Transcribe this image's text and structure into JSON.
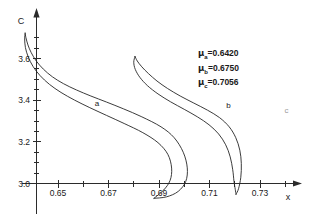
{
  "chart_data": {
    "type": "line",
    "title": "",
    "xlabel": "x",
    "ylabel": "C",
    "xlim": [
      0.632,
      0.742
    ],
    "ylim": [
      2.9,
      3.76
    ],
    "grid": false,
    "legend_position": "upper-right",
    "xticks": [
      "0.65",
      "0.67",
      "0.69",
      "0.71",
      "0.73"
    ],
    "xtick_values": [
      0.65,
      0.67,
      0.69,
      0.71,
      0.73
    ],
    "xminor_step": 0.01,
    "yticks": [
      "3.0",
      "3.2",
      "3.4",
      "3.6"
    ],
    "ytick_values": [
      3.0,
      3.2,
      3.4,
      3.6
    ],
    "yminor_step": 0.05,
    "annotations": [
      {
        "text": "a",
        "x": 0.6655,
        "y": 3.372,
        "faint": false
      },
      {
        "text": "b",
        "x": 0.7175,
        "y": 3.365,
        "faint": false
      },
      {
        "text": "c",
        "x": 0.7405,
        "y": 3.34,
        "faint": true
      }
    ],
    "series": [
      {
        "name": "a",
        "label": "a",
        "mu": 0.642,
        "branch_upper": [
          [
            0.637,
            3.722
          ],
          [
            0.6373,
            3.7
          ],
          [
            0.6381,
            3.665
          ],
          [
            0.6394,
            3.628
          ],
          [
            0.6414,
            3.588
          ],
          [
            0.6442,
            3.549
          ],
          [
            0.6478,
            3.512
          ],
          [
            0.6522,
            3.479
          ],
          [
            0.6573,
            3.449
          ],
          [
            0.663,
            3.42
          ],
          [
            0.6692,
            3.391
          ],
          [
            0.676,
            3.358
          ],
          [
            0.6832,
            3.32
          ],
          [
            0.6908,
            3.272
          ],
          [
            0.696,
            3.22
          ],
          [
            0.6996,
            3.15
          ],
          [
            0.7012,
            3.075
          ],
          [
            0.7006,
            3.01
          ],
          [
            0.6976,
            2.962
          ],
          [
            0.693,
            2.936
          ],
          [
            0.688,
            2.929
          ]
        ],
        "branch_lower": [
          [
            0.637,
            3.722
          ],
          [
            0.6368,
            3.694
          ],
          [
            0.6371,
            3.652
          ],
          [
            0.6382,
            3.608
          ],
          [
            0.6401,
            3.562
          ],
          [
            0.6429,
            3.518
          ],
          [
            0.6466,
            3.476
          ],
          [
            0.6512,
            3.437
          ],
          [
            0.6566,
            3.4
          ],
          [
            0.6626,
            3.364
          ],
          [
            0.6692,
            3.327
          ],
          [
            0.6762,
            3.288
          ],
          [
            0.6836,
            3.244
          ],
          [
            0.6896,
            3.196
          ],
          [
            0.6935,
            3.14
          ],
          [
            0.695,
            3.074
          ],
          [
            0.6944,
            3.015
          ],
          [
            0.6918,
            2.968
          ],
          [
            0.688,
            2.929
          ]
        ]
      },
      {
        "name": "b",
        "label": "b",
        "mu": 0.675,
        "branch_upper": [
          [
            0.6805,
            3.61
          ],
          [
            0.6814,
            3.588
          ],
          [
            0.6832,
            3.56
          ],
          [
            0.6858,
            3.528
          ],
          [
            0.6892,
            3.492
          ],
          [
            0.6934,
            3.456
          ],
          [
            0.6984,
            3.42
          ],
          [
            0.7038,
            3.386
          ],
          [
            0.7092,
            3.352
          ],
          [
            0.714,
            3.316
          ],
          [
            0.7178,
            3.272
          ],
          [
            0.7204,
            3.22
          ],
          [
            0.722,
            3.16
          ],
          [
            0.7226,
            3.096
          ],
          [
            0.7224,
            3.03
          ],
          [
            0.7215,
            2.975
          ],
          [
            0.7205,
            2.948
          ]
        ],
        "branch_lower": [
          [
            0.6805,
            3.61
          ],
          [
            0.68,
            3.582
          ],
          [
            0.6806,
            3.548
          ],
          [
            0.6824,
            3.51
          ],
          [
            0.6854,
            3.47
          ],
          [
            0.6896,
            3.43
          ],
          [
            0.6946,
            3.392
          ],
          [
            0.7,
            3.356
          ],
          [
            0.7052,
            3.32
          ],
          [
            0.7098,
            3.282
          ],
          [
            0.7136,
            3.238
          ],
          [
            0.7164,
            3.186
          ],
          [
            0.7182,
            3.128
          ],
          [
            0.7192,
            3.066
          ],
          [
            0.7197,
            3.01
          ],
          [
            0.7202,
            2.972
          ],
          [
            0.7205,
            2.948
          ]
        ]
      }
    ]
  },
  "legend": {
    "rows": [
      {
        "symbol": "μ",
        "subscript": "a",
        "equals": "=",
        "value": "0.6420"
      },
      {
        "symbol": "μ",
        "subscript": "b",
        "equals": "=",
        "value": "0.6750"
      },
      {
        "symbol": "μ",
        "subscript": "c",
        "equals": "=",
        "value": "0.7056"
      }
    ]
  }
}
